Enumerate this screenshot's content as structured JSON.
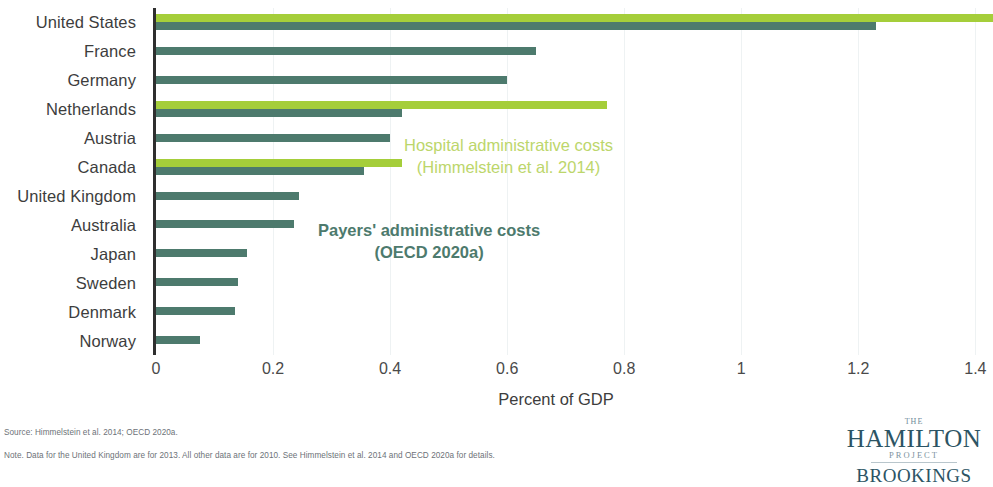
{
  "chart_data": {
    "type": "bar",
    "orientation": "horizontal",
    "title": "",
    "xlabel": "Percent of GDP",
    "ylabel": "",
    "xlim": [
      0,
      1.425
    ],
    "xticks": [
      "0",
      "0.2",
      "0.4",
      "0.6",
      "0.8",
      "1",
      "1.2",
      "1.4"
    ],
    "xtick_values": [
      0,
      0.2,
      0.4,
      0.6,
      0.8,
      1,
      1.2,
      1.4
    ],
    "grid": true,
    "legend_position": "inside-center",
    "categories": [
      "United States",
      "France",
      "Germany",
      "Netherlands",
      "Austria",
      "Canada",
      "United Kingdom",
      "Australia",
      "Japan",
      "Sweden",
      "Denmark",
      "Norway"
    ],
    "series": [
      {
        "name": "Hospital administrative costs",
        "source": "Himmelstein et al. 2014",
        "color": "#a5ce3a",
        "values": [
          1.43,
          null,
          null,
          0.77,
          null,
          0.42,
          null,
          null,
          null,
          null,
          null,
          null
        ]
      },
      {
        "name": "Payers' administrative costs",
        "source": "OECD 2020a",
        "color": "#4d7a6d",
        "values": [
          1.23,
          0.65,
          0.6,
          0.42,
          0.4,
          0.355,
          0.245,
          0.235,
          0.155,
          0.14,
          0.135,
          0.075
        ]
      }
    ]
  },
  "legend": {
    "hospital_line1": "Hospital administrative costs",
    "hospital_line2": "(Himmelstein et al. 2014)",
    "payers_line1": "Payers' administrative costs",
    "payers_line2": "(OECD 2020a)"
  },
  "footnotes": {
    "source": "Source: Himmelstein et al. 2014; OECD 2020a.",
    "note": "Note. Data for the United Kingdom are for 2013. All other data are for 2010. See Himmelstein et al. 2014 and OECD 2020a for details."
  },
  "logo": {
    "the": "THE",
    "hamilton": "HAMILTON",
    "project": "PROJECT",
    "brookings": "BROOKINGS"
  }
}
